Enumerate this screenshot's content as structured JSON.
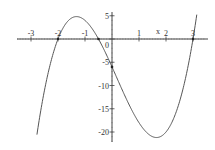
{
  "chart_data": {
    "type": "line",
    "title": "",
    "function": "(x+2)(2x+1)(x-3)",
    "xlabel": "x",
    "ylabel": "",
    "xlim": [
      -3.1,
      3.5
    ],
    "ylim": [
      -22,
      6
    ],
    "x_ticks": [
      "-3",
      "-2",
      "-1",
      "1",
      "2",
      "3"
    ],
    "y_ticks": [
      "5",
      "0",
      "-5",
      "-10",
      "-15",
      "-20"
    ],
    "roots": [
      -2,
      -0.5,
      3
    ],
    "y_intercept": -6,
    "local_max": {
      "x": -1.27,
      "y": 4.8
    },
    "local_min": {
      "x": 1.77,
      "y": -21.1
    },
    "grid": false,
    "series": [
      {
        "name": "f(x)",
        "x": [
          -2.78,
          -2.5,
          -2,
          -1.5,
          -1.27,
          -1,
          -0.5,
          0,
          0.5,
          1,
          1.5,
          1.77,
          2,
          2.5,
          3,
          3.15
        ],
        "values": [
          -20.6,
          -9.0,
          0,
          4.5,
          4.8,
          4.0,
          0,
          -6,
          -12.5,
          -18,
          -21.0,
          -21.1,
          -20,
          -13.5,
          0,
          5.6
        ]
      }
    ],
    "color": "#555555"
  }
}
